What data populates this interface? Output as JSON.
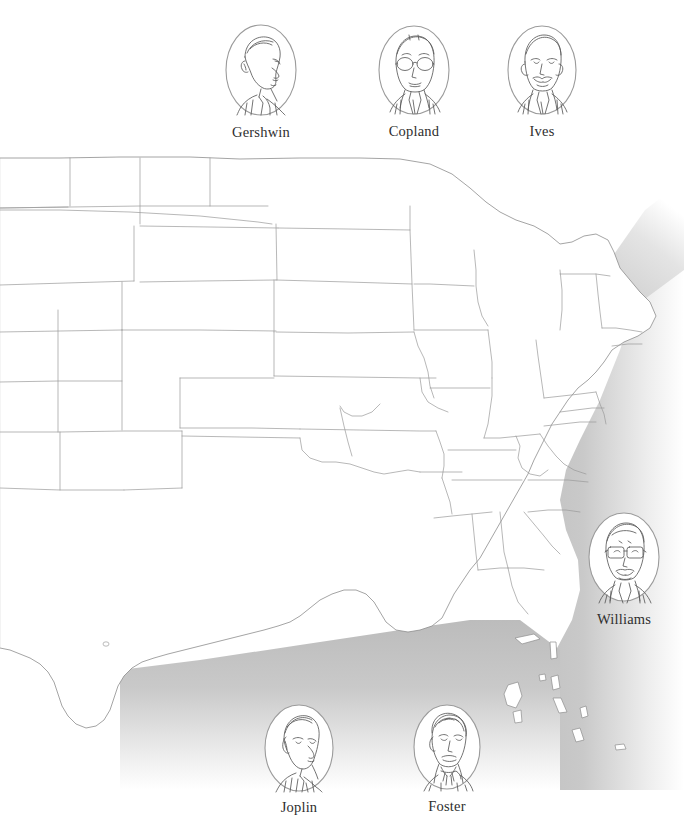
{
  "figure": {
    "title_sliver": "",
    "map_region": "United States",
    "ocean_color": "#c8c8c8",
    "lake_color": "#cccccc",
    "outline_color": "#8a8a8a",
    "land_color": "#ffffff",
    "label_color": "#2e2e2e"
  },
  "portraits": [
    {
      "id": "gershwin",
      "name": "Gershwin",
      "position": "top-left",
      "over": "land-north-central"
    },
    {
      "id": "copland",
      "name": "Copland",
      "position": "top-center",
      "over": "land-north-central"
    },
    {
      "id": "ives",
      "name": "Ives",
      "position": "top-right",
      "over": "land-north-east"
    },
    {
      "id": "williams",
      "name": "Williams",
      "position": "right",
      "over": "atlantic-ocean"
    },
    {
      "id": "joplin",
      "name": "Joplin",
      "position": "bottom-left",
      "over": "gulf-of-mexico"
    },
    {
      "id": "foster",
      "name": "Foster",
      "position": "bottom-right",
      "over": "gulf-of-mexico"
    }
  ]
}
